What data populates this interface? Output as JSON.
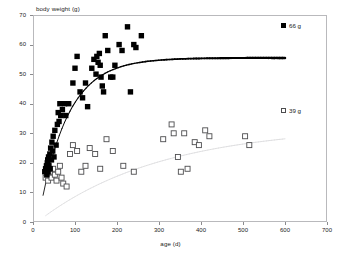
{
  "chart_data": {
    "type": "scatter",
    "title": "",
    "xlabel": "age (d)",
    "ylabel": "body weight (g)",
    "xlim": [
      0,
      700
    ],
    "ylim": [
      0,
      70
    ],
    "xticks": [
      0,
      100,
      200,
      300,
      400,
      500,
      600,
      700
    ],
    "yticks": [
      0,
      10,
      20,
      30,
      40,
      50,
      60,
      70
    ],
    "grid": false,
    "legend_position": "right",
    "series": [
      {
        "name": "66 g",
        "marker": "filled-square",
        "color": "#000000",
        "points": [
          [
            28,
            17
          ],
          [
            30,
            18
          ],
          [
            32,
            19
          ],
          [
            33,
            16
          ],
          [
            34,
            20
          ],
          [
            35,
            21
          ],
          [
            36,
            17
          ],
          [
            37,
            22
          ],
          [
            38,
            19
          ],
          [
            40,
            23
          ],
          [
            41,
            18
          ],
          [
            42,
            25
          ],
          [
            44,
            21
          ],
          [
            45,
            27
          ],
          [
            47,
            24
          ],
          [
            48,
            29
          ],
          [
            50,
            22
          ],
          [
            52,
            31
          ],
          [
            55,
            26
          ],
          [
            58,
            33
          ],
          [
            60,
            37
          ],
          [
            62,
            34
          ],
          [
            64,
            40
          ],
          [
            66,
            36
          ],
          [
            70,
            38
          ],
          [
            75,
            40
          ],
          [
            78,
            36
          ],
          [
            85,
            40
          ],
          [
            95,
            47
          ],
          [
            100,
            52
          ],
          [
            105,
            56
          ],
          [
            112,
            44
          ],
          [
            118,
            42
          ],
          [
            125,
            47
          ],
          [
            130,
            39
          ],
          [
            140,
            52
          ],
          [
            145,
            55
          ],
          [
            150,
            50
          ],
          [
            152,
            56
          ],
          [
            155,
            54
          ],
          [
            158,
            57
          ],
          [
            160,
            53
          ],
          [
            162,
            49
          ],
          [
            165,
            46
          ],
          [
            168,
            44
          ],
          [
            172,
            63
          ],
          [
            178,
            58
          ],
          [
            185,
            49
          ],
          [
            190,
            49
          ],
          [
            195,
            53
          ],
          [
            205,
            60
          ],
          [
            212,
            58
          ],
          [
            225,
            66
          ],
          [
            232,
            44
          ],
          [
            240,
            60
          ],
          [
            245,
            59
          ],
          [
            258,
            63
          ]
        ]
      },
      {
        "name": "39 g",
        "marker": "open-square",
        "color": "#4d4d4f",
        "points": [
          [
            30,
            15
          ],
          [
            33,
            16
          ],
          [
            36,
            14
          ],
          [
            40,
            17
          ],
          [
            44,
            15
          ],
          [
            48,
            18
          ],
          [
            52,
            16
          ],
          [
            56,
            14
          ],
          [
            60,
            17
          ],
          [
            64,
            19
          ],
          [
            68,
            15
          ],
          [
            72,
            13
          ],
          [
            80,
            12
          ],
          [
            88,
            23
          ],
          [
            95,
            26
          ],
          [
            105,
            24
          ],
          [
            115,
            17
          ],
          [
            125,
            19
          ],
          [
            135,
            25
          ],
          [
            148,
            23
          ],
          [
            160,
            18
          ],
          [
            175,
            28
          ],
          [
            190,
            24
          ],
          [
            215,
            19
          ],
          [
            240,
            17
          ],
          [
            310,
            28
          ],
          [
            330,
            33
          ],
          [
            335,
            30
          ],
          [
            345,
            22
          ],
          [
            352,
            17
          ],
          [
            360,
            30
          ],
          [
            368,
            18
          ],
          [
            385,
            27
          ],
          [
            395,
            26
          ],
          [
            410,
            31
          ],
          [
            420,
            29
          ],
          [
            505,
            29
          ],
          [
            515,
            26
          ]
        ]
      }
    ],
    "fit_curves": [
      {
        "name": "66 g growth curve",
        "style": "solid",
        "color": "#000000",
        "description": "Monotonic growth curve rising steeply from ~15 g at 25 d, reaching ~50 g near 110 d and plateauing at ~54 g from ~200 d through ~600 d"
      },
      {
        "name": "39 g growth curve",
        "style": "solid-light",
        "color": "#d8d8da",
        "description": "Shallow growth curve rising from ~15 g at 25 d to a plateau near ~30 g at ~600 d"
      }
    ]
  },
  "legend": {
    "entries": [
      {
        "label": "66 g",
        "marker": "filled-square"
      },
      {
        "label": "39 g",
        "marker": "open-square"
      }
    ]
  }
}
